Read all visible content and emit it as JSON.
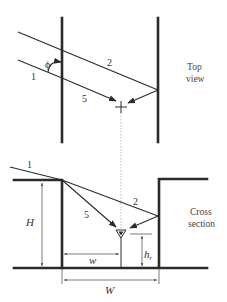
{
  "top_view": {
    "caption_line1": "Top",
    "caption_line2": "view",
    "angle_label": "ϕ",
    "ray_labels": {
      "ray1": "1",
      "ray2": "2",
      "ray5": "5"
    }
  },
  "cross_section": {
    "caption_line1": "Cross",
    "caption_line2": "section",
    "ray_labels": {
      "ray1": "1",
      "ray2": "2",
      "ray5": "5"
    },
    "dimensions": {
      "height": "H",
      "receiver_height": "h",
      "receiver_height_sub": "r",
      "receiver_distance": "w",
      "street_width": "W"
    }
  },
  "colors": {
    "line": "#2a2a2a",
    "guide": "#aaaaaa"
  }
}
